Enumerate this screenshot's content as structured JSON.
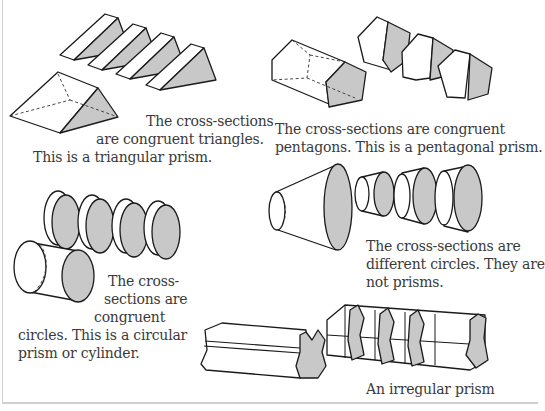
{
  "figure": {
    "panels": [
      {
        "id": "triangular",
        "shape": "triangular-prism",
        "lines": [
          "The cross-sections",
          "are congruent triangles.",
          "This is a triangular prism."
        ]
      },
      {
        "id": "pentagonal",
        "shape": "pentagonal-prism",
        "lines": [
          "The cross-sections are congruent",
          "pentagons. This is a pentagonal prism."
        ]
      },
      {
        "id": "cylinder",
        "shape": "cylinder",
        "lines": [
          "The cross-",
          "sections are",
          "congruent",
          "circles. This is a circular",
          "prism or cylinder."
        ]
      },
      {
        "id": "cone",
        "shape": "truncated-cone",
        "lines": [
          "The cross-sections are",
          "different circles. They are",
          "not prisms."
        ]
      },
      {
        "id": "irregular",
        "shape": "irregular-prism",
        "lines": [
          "An irregular prism"
        ]
      }
    ],
    "colors": {
      "stroke": "#1a1a1a",
      "cross_section_fill": "#c8c8c8",
      "text": "#3a3a3a",
      "border": "#cfcfcf"
    }
  }
}
